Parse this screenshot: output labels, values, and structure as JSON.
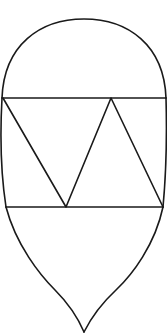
{
  "figure": {
    "title": "",
    "stroke_color": "#1a1a1a",
    "background": "#ffffff",
    "shapes": {
      "dome": "semicircle arc",
      "band_top_line": "horizontal line",
      "band_bottom_line": "horizontal line",
      "triangles": 3,
      "base": "concave-curved point"
    }
  }
}
